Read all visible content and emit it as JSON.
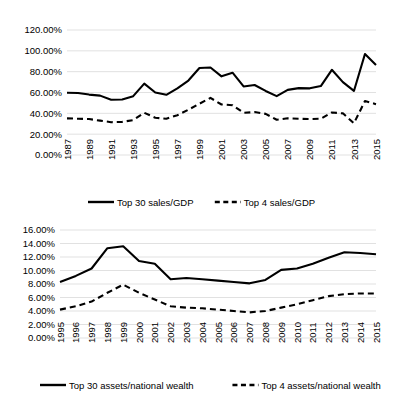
{
  "chart_data": [
    {
      "id": "sales-gdp",
      "type": "line",
      "title": "",
      "xlabel": "",
      "ylabel": "",
      "ylim": [
        0,
        1.2
      ],
      "ytick_labels": [
        "120.00%",
        "100.00%",
        "80.00%",
        "60.00%",
        "40.00%",
        "20.00%",
        "0.00%"
      ],
      "ytick_values": [
        1.2,
        1.0,
        0.8,
        0.6,
        0.4,
        0.2,
        0.0
      ],
      "grid": true,
      "legend_position": "bottom",
      "x": [
        1987,
        1988,
        1989,
        1990,
        1991,
        1992,
        1993,
        1994,
        1995,
        1996,
        1997,
        1998,
        1999,
        2000,
        2001,
        2002,
        2003,
        2004,
        2005,
        2006,
        2007,
        2008,
        2009,
        2010,
        2011,
        2012,
        2013,
        2014,
        2015
      ],
      "xtick_labels": [
        "1987",
        "1989",
        "1991",
        "1993",
        "1995",
        "1997",
        "1999",
        "2001",
        "2003",
        "2005",
        "2007",
        "2009",
        "2011",
        "2013",
        "2015"
      ],
      "xtick_values": [
        1987,
        1989,
        1991,
        1993,
        1995,
        1997,
        1999,
        2001,
        2003,
        2005,
        2007,
        2009,
        2011,
        2013,
        2015
      ],
      "series": [
        {
          "name": "Top 30 sales/GDP",
          "style": "solid",
          "values": [
            0.598,
            0.595,
            0.58,
            0.57,
            0.53,
            0.533,
            0.565,
            0.685,
            0.6,
            0.578,
            0.64,
            0.715,
            0.835,
            0.84,
            0.755,
            0.79,
            0.658,
            0.672,
            0.615,
            0.565,
            0.625,
            0.642,
            0.64,
            0.662,
            0.818,
            0.7,
            0.615,
            0.97,
            0.865
          ]
        },
        {
          "name": "Top 4 sales/GDP",
          "style": "dashed",
          "values": [
            0.352,
            0.348,
            0.345,
            0.33,
            0.315,
            0.318,
            0.335,
            0.405,
            0.358,
            0.348,
            0.382,
            0.435,
            0.492,
            0.548,
            0.485,
            0.478,
            0.405,
            0.412,
            0.395,
            0.338,
            0.352,
            0.348,
            0.345,
            0.348,
            0.408,
            0.4,
            0.305,
            0.518,
            0.488
          ]
        }
      ]
    },
    {
      "id": "assets-national-wealth",
      "type": "line",
      "title": "",
      "xlabel": "",
      "ylabel": "",
      "ylim": [
        0,
        0.16
      ],
      "ytick_labels": [
        "16.00%",
        "14.00%",
        "12.00%",
        "10.00%",
        "8.00%",
        "6.00%",
        "4.00%",
        "2.00%",
        "0.00%"
      ],
      "ytick_values": [
        0.16,
        0.14,
        0.12,
        0.1,
        0.08,
        0.06,
        0.04,
        0.02,
        0.0
      ],
      "grid": true,
      "legend_position": "bottom",
      "x": [
        1995,
        1996,
        1997,
        1998,
        1999,
        2000,
        2001,
        2002,
        2003,
        2004,
        2005,
        2006,
        2007,
        2008,
        2009,
        2010,
        2011,
        2012,
        2013,
        2014,
        2015
      ],
      "xtick_labels": [
        "1995",
        "1996",
        "1997",
        "1998",
        "1999",
        "2000",
        "2001",
        "2002",
        "2003",
        "2004",
        "2005",
        "2006",
        "2007",
        "2008",
        "2009",
        "2010",
        "2011",
        "2012",
        "2013",
        "2014",
        "2015"
      ],
      "xtick_values": [
        1995,
        1996,
        1997,
        1998,
        1999,
        2000,
        2001,
        2002,
        2003,
        2004,
        2005,
        2006,
        2007,
        2008,
        2009,
        2010,
        2011,
        2012,
        2013,
        2014,
        2015
      ],
      "series": [
        {
          "name": "Top 30 assets/national wealth",
          "style": "solid",
          "values": [
            0.083,
            0.092,
            0.103,
            0.133,
            0.136,
            0.114,
            0.11,
            0.087,
            0.089,
            0.087,
            0.085,
            0.083,
            0.081,
            0.086,
            0.101,
            0.103,
            0.11,
            0.119,
            0.127,
            0.126,
            0.124
          ]
        },
        {
          "name": "Top 4 assets/national wealth",
          "style": "dashed",
          "values": [
            0.042,
            0.047,
            0.054,
            0.067,
            0.079,
            0.067,
            0.057,
            0.047,
            0.045,
            0.044,
            0.042,
            0.04,
            0.038,
            0.04,
            0.045,
            0.05,
            0.056,
            0.062,
            0.065,
            0.066,
            0.066
          ]
        }
      ]
    }
  ],
  "charts": {
    "top": {
      "legend": [
        {
          "label": "Top 30 sales/GDP",
          "style": "solid"
        },
        {
          "label": "Top 4 sales/GDP",
          "style": "dashed"
        }
      ]
    },
    "bottom": {
      "legend": [
        {
          "label": "Top 30 assets/national wealth",
          "style": "solid"
        },
        {
          "label": "Top 4 assets/national wealth",
          "style": "dashed"
        }
      ]
    }
  },
  "colors": {
    "line": "#000000",
    "grid": "#d9d9d9",
    "background": "#ffffff",
    "text": "#000000"
  }
}
